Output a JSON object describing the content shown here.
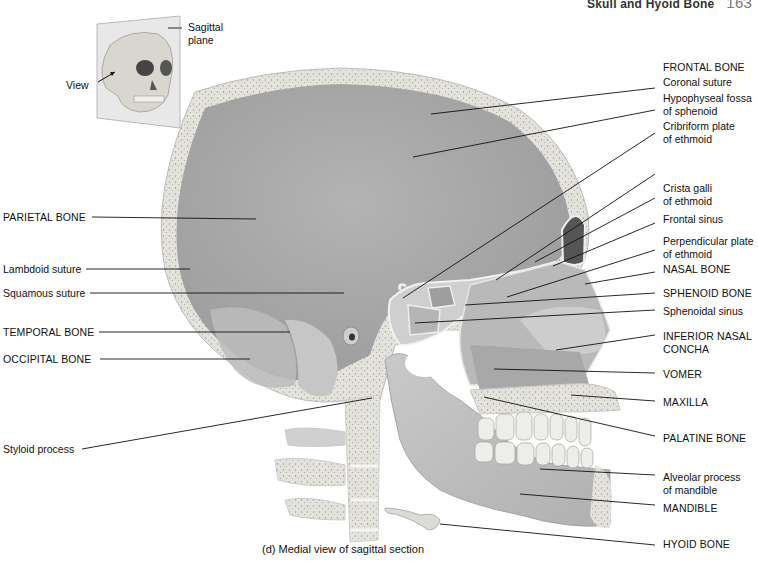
{
  "header": {
    "section_title": "Skull and Hyoid Bone",
    "page_number": "163"
  },
  "inset": {
    "plane_label": "Sagittal\nplane",
    "plane_label_line1": "Sagittal",
    "plane_label_line2": "plane",
    "view_label": "View"
  },
  "labels_left": [
    {
      "id": "parietal-bone",
      "text": "PARIETAL BONE"
    },
    {
      "id": "lambdoid-suture",
      "text": "Lambdoid suture"
    },
    {
      "id": "squamous-suture",
      "text": "Squamous suture"
    },
    {
      "id": "temporal-bone",
      "text": "TEMPORAL BONE"
    },
    {
      "id": "occipital-bone",
      "text": "OCCIPITAL BONE"
    },
    {
      "id": "styloid-process",
      "text": "Styloid process"
    }
  ],
  "labels_right": [
    {
      "id": "frontal-bone",
      "text": "FRONTAL BONE"
    },
    {
      "id": "coronal-suture",
      "text": "Coronal suture"
    },
    {
      "id": "hypophyseal-fossa",
      "line1": "Hypophyseal fossa",
      "line2": "of sphenoid"
    },
    {
      "id": "cribriform-plate",
      "line1": "Cribriform plate",
      "line2": "of ethmoid"
    },
    {
      "id": "crista-galli",
      "line1": "Crista galli",
      "line2": "of ethmoid"
    },
    {
      "id": "frontal-sinus",
      "text": "Frontal sinus"
    },
    {
      "id": "perpendicular-plate",
      "line1": "Perpendicular plate",
      "line2": "of ethmoid"
    },
    {
      "id": "nasal-bone",
      "text": "NASAL BONE"
    },
    {
      "id": "sphenoid-bone",
      "text": "SPHENOID BONE"
    },
    {
      "id": "sphenoidal-sinus",
      "text": "Sphenoidal sinus"
    },
    {
      "id": "inferior-nasal-concha",
      "line1": "INFERIOR NASAL",
      "line2": "CONCHA"
    },
    {
      "id": "vomer",
      "text": "VOMER"
    },
    {
      "id": "maxilla",
      "text": "MAXILLA"
    },
    {
      "id": "palatine-bone",
      "text": "PALATINE BONE"
    },
    {
      "id": "alveolar-process",
      "line1": "Alveolar process",
      "line2": "of mandible"
    },
    {
      "id": "mandible",
      "text": "MANDIBLE"
    },
    {
      "id": "hyoid-bone",
      "text": "HYOID BONE"
    }
  ],
  "caption": "(d) Medial view of sagittal section",
  "colors": {
    "cranial_cavity": "#a9a9a9",
    "bone_section": "#e3e1dc",
    "bone_surface": "#c4c4c4",
    "leader_line": "#111111"
  }
}
